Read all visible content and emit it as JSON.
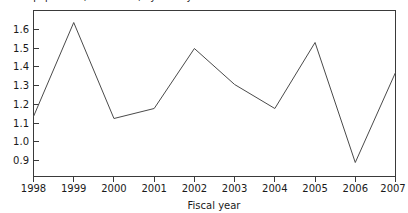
{
  "chart_data": {
    "type": "line",
    "title": "Total population, in millions, by fiscal year",
    "xlabel": "Fiscal year",
    "ylabel": "",
    "categories": [
      "1998",
      "1999",
      "2000",
      "2001",
      "2002",
      "2003",
      "2004",
      "2005",
      "2006",
      "2007"
    ],
    "x": [
      1998,
      1999,
      2000,
      2001,
      2002,
      2003,
      2004,
      2005,
      2006,
      2007
    ],
    "values": [
      1.13,
      1.6,
      1.12,
      1.17,
      1.47,
      1.29,
      1.17,
      1.5,
      0.9,
      1.35
    ],
    "series": [
      {
        "name": "",
        "values": [
          1.13,
          1.6,
          1.12,
          1.17,
          1.47,
          1.29,
          1.17,
          1.5,
          0.9,
          1.35
        ]
      }
    ],
    "ytick_labels": [
      "1.6",
      "1.5",
      "1.4",
      "1.3",
      "1.2",
      "1.1",
      "1.0",
      "0.9"
    ],
    "ytick_values": [
      1.6,
      1.5,
      1.4,
      1.3,
      1.2,
      1.1,
      1.0,
      0.9
    ],
    "xtick_labels": [
      "1998",
      "1999",
      "2000",
      "2001",
      "2002",
      "2003",
      "2004",
      "2005",
      "2006",
      "2007"
    ],
    "ylim": [
      0.83,
      1.66
    ],
    "xlim": [
      1998,
      2007
    ],
    "grid": false,
    "legend": null,
    "legend_position": "none",
    "line_color": "#4a4a4a",
    "axis_color": "#3a3a3a",
    "background_color": "#ffffff"
  },
  "axis": {
    "x_title": "Fiscal year",
    "y_title": ""
  }
}
